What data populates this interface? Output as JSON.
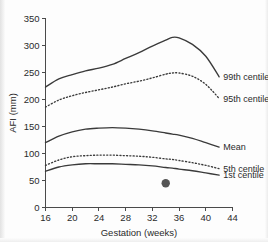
{
  "chart_data": {
    "type": "line",
    "title": "",
    "xlabel": "Gestation (weeks)",
    "ylabel": "AFI (mm)",
    "xlim": [
      16,
      44
    ],
    "ylim": [
      0,
      350
    ],
    "xticks": [
      16,
      20,
      24,
      28,
      32,
      36,
      40,
      44
    ],
    "yticks": [
      0,
      50,
      100,
      150,
      200,
      250,
      300,
      350
    ],
    "grid": false,
    "legend_position": "right-inline-labels",
    "x": [
      16,
      18,
      20,
      22,
      24,
      26,
      28,
      30,
      32,
      34,
      35,
      36,
      38,
      40,
      42
    ],
    "series": [
      {
        "name": "99th centile",
        "style": "solid",
        "label": "99th centile",
        "values": [
          223,
          238,
          246,
          253,
          258,
          265,
          276,
          287,
          299,
          310,
          315,
          314,
          302,
          280,
          242
        ]
      },
      {
        "name": "95th centile",
        "style": "dotted",
        "label": "95th centile",
        "values": [
          186,
          199,
          207,
          213,
          218,
          223,
          229,
          234,
          240,
          247,
          249,
          249,
          243,
          228,
          202
        ]
      },
      {
        "name": "Mean",
        "style": "solid",
        "label": "Mean",
        "values": [
          120,
          132,
          140,
          145,
          147,
          148,
          147,
          145,
          142,
          138,
          136,
          134,
          128,
          120,
          112
        ]
      },
      {
        "name": "5th centile",
        "style": "dotted",
        "label": "5th centile",
        "values": [
          78,
          88,
          94,
          96,
          97,
          97,
          96,
          95,
          93,
          90,
          89,
          87,
          83,
          78,
          72
        ]
      },
      {
        "name": "1st centile",
        "style": "solid",
        "label": "1st centile",
        "values": [
          67,
          75,
          79,
          81,
          81,
          81,
          80,
          79,
          77,
          74,
          73,
          71,
          68,
          64,
          60
        ]
      }
    ],
    "annotations": [
      {
        "name": "measurement-point",
        "marker": "filled-circle",
        "x": 34,
        "y": 45
      }
    ],
    "colors": {
      "line": "#3a3a3a",
      "axis": "#4a4a4a",
      "text": "#2b2b2b",
      "marker": "#555555",
      "background": "#fdfdfd"
    }
  }
}
